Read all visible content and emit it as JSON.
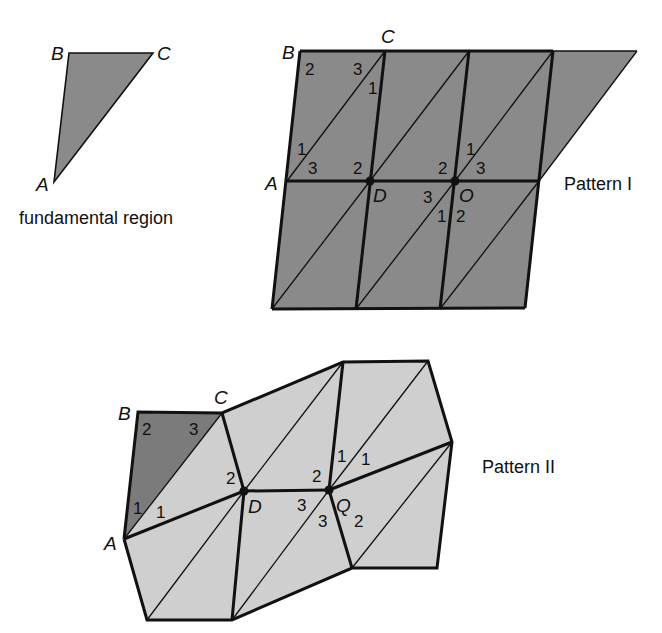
{
  "colors": {
    "dark_fill": "#8a8a8a",
    "darker_fill": "#7b7b7b",
    "light_fill": "#cfcfcf",
    "stroke": "#111111",
    "background": "#ffffff"
  },
  "fundamental_region": {
    "caption": "fundamental region",
    "vertices": {
      "A": "A",
      "B": "B",
      "C": "C"
    }
  },
  "pattern_1": {
    "caption": "Pattern I",
    "vertex_labels": {
      "A": "A",
      "B": "B",
      "C": "C",
      "D": "D",
      "O": "O"
    },
    "angle_labels": {
      "b_corner": "2",
      "c_top": "3",
      "c_below": "1",
      "a_upper": "1",
      "a_right": "3",
      "d_upper_left": "2",
      "o_upper_left": "2",
      "o_upper": "1",
      "o_upper_right": "3",
      "o_lower_left": "3",
      "o_lower_1": "1",
      "o_lower_2": "2"
    }
  },
  "pattern_2": {
    "caption": "Pattern II",
    "vertex_labels": {
      "A": "A",
      "B": "B",
      "C": "C",
      "D": "D",
      "Q": "Q"
    },
    "angle_labels": {
      "b_corner": "2",
      "c_corner": "3",
      "a_upper": "1",
      "a_right": "1",
      "d_upper_left": "2",
      "q_upper_left": "2",
      "q_upper": "1",
      "q_upper_right": "1",
      "q_left": "3",
      "q_lower": "3",
      "q_lower_right": "2"
    }
  }
}
